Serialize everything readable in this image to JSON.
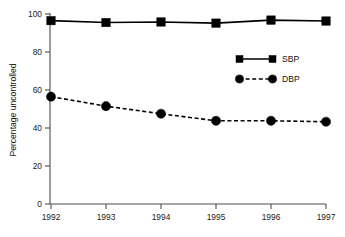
{
  "chart_data": {
    "type": "line",
    "title": "",
    "subtitle": "",
    "xlabel": "",
    "ylabel": "Percentage uncontrolled",
    "categories": [
      "1992",
      "1993",
      "1994",
      "1995",
      "1996",
      "1997"
    ],
    "x": [
      1992,
      1993,
      1994,
      1995,
      1996,
      1997
    ],
    "xlim": [
      1992,
      1997
    ],
    "ylim": [
      0,
      100
    ],
    "yticks": [
      0,
      20,
      40,
      60,
      80,
      100
    ],
    "ytick_labels": [
      "0",
      "20",
      "40",
      "60",
      "80",
      "100"
    ],
    "xtick_labels": [
      "1992",
      "1993",
      "1994",
      "1995",
      "1996",
      "1997"
    ],
    "grid": false,
    "legend_position": "upper-right-inside",
    "series": [
      {
        "name": "SBP",
        "values": [
          96.5,
          95.5,
          95.8,
          95.2,
          96.8,
          96.3
        ],
        "line_style": "solid",
        "marker": "square",
        "color": "#000000"
      },
      {
        "name": "DBP",
        "values": [
          56.5,
          51.5,
          47.5,
          43.8,
          43.8,
          43.3
        ],
        "line_style": "dashed",
        "marker": "circle",
        "color": "#000000"
      }
    ],
    "annotations": []
  },
  "legend": {
    "items": [
      {
        "label": "SBP"
      },
      {
        "label": "DBP"
      }
    ]
  },
  "colors": {
    "ink": "#000000",
    "axis": "#4d4d4d",
    "background": "#ffffff"
  }
}
